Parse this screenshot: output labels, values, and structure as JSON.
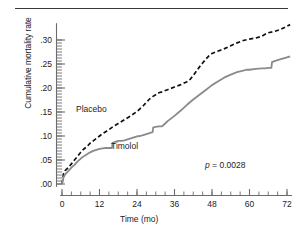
{
  "figure": {
    "has_top_rule": true,
    "background_color": "#ffffff"
  },
  "chart_data": {
    "type": "line",
    "title": "",
    "xlabel": "Time (mo)",
    "ylabel": "Cumulative mortality rate",
    "xlim": [
      0,
      74
    ],
    "ylim": [
      0,
      0.335
    ],
    "xticks": [
      0,
      12,
      24,
      36,
      48,
      60,
      72
    ],
    "xtick_labels": [
      "0",
      "12",
      "24",
      "36",
      "48",
      "60",
      "72"
    ],
    "x_minor_tick_interval": 3,
    "yticks": [
      0.0,
      0.05,
      0.1,
      0.15,
      0.2,
      0.25,
      0.3
    ],
    "ytick_labels": [
      ".00",
      ".05",
      ".10",
      ".15",
      ".20",
      ".25",
      ".30"
    ],
    "y_minor_tick_interval": 0.00625,
    "grid": false,
    "legend_position": "inline-annotations",
    "annotations": [
      {
        "name": "p-value",
        "text": "p = 0.0028",
        "italic_prefix": "p",
        "x": 62,
        "y": 0.045
      }
    ],
    "series": [
      {
        "name": "Placebo",
        "style": "dashed",
        "color": "#111111",
        "label_x": 14,
        "label_y": 0.168,
        "x": [
          0,
          0.5,
          1,
          2,
          3,
          4,
          5,
          6,
          7,
          8,
          9,
          10,
          11,
          12,
          13,
          14,
          15,
          16,
          18,
          20,
          22,
          24,
          25,
          26,
          27,
          28,
          29,
          30,
          31,
          32,
          34,
          36,
          38,
          40,
          41,
          42,
          43,
          44,
          45,
          46,
          47,
          48,
          50,
          52,
          54,
          56,
          58,
          60,
          62,
          64,
          65,
          66,
          68,
          70,
          72,
          73
        ],
        "y": [
          0.0,
          0.022,
          0.028,
          0.034,
          0.042,
          0.05,
          0.058,
          0.066,
          0.073,
          0.078,
          0.085,
          0.09,
          0.095,
          0.1,
          0.105,
          0.109,
          0.113,
          0.118,
          0.126,
          0.134,
          0.142,
          0.151,
          0.157,
          0.163,
          0.17,
          0.177,
          0.182,
          0.186,
          0.19,
          0.192,
          0.197,
          0.202,
          0.207,
          0.213,
          0.218,
          0.226,
          0.235,
          0.244,
          0.252,
          0.26,
          0.267,
          0.272,
          0.277,
          0.282,
          0.288,
          0.294,
          0.299,
          0.302,
          0.304,
          0.308,
          0.312,
          0.315,
          0.318,
          0.322,
          0.329,
          0.332
        ]
      },
      {
        "name": "Timolol",
        "style": "solid",
        "color": "#8a8a8a",
        "label_x": 30,
        "label_y": 0.093,
        "x": [
          0,
          0.5,
          1,
          2,
          3,
          4,
          5,
          6,
          7,
          8,
          9,
          10,
          11,
          12,
          13,
          14,
          15,
          16,
          16.2,
          17,
          18,
          19,
          20,
          21,
          22,
          23,
          24,
          25,
          26,
          27,
          28,
          29,
          29.2,
          30,
          31,
          32,
          33,
          34,
          36,
          38,
          40,
          42,
          44,
          46,
          48,
          50,
          52,
          54,
          56,
          58,
          59,
          60,
          62,
          64,
          65,
          66,
          67,
          67.2,
          68,
          70,
          72,
          73
        ],
        "y": [
          0.0,
          0.014,
          0.02,
          0.027,
          0.034,
          0.04,
          0.047,
          0.053,
          0.058,
          0.062,
          0.066,
          0.069,
          0.071,
          0.073,
          0.074,
          0.075,
          0.075,
          0.075,
          0.086,
          0.088,
          0.09,
          0.09,
          0.091,
          0.093,
          0.095,
          0.097,
          0.099,
          0.1,
          0.102,
          0.104,
          0.106,
          0.108,
          0.118,
          0.119,
          0.12,
          0.12,
          0.126,
          0.132,
          0.142,
          0.153,
          0.165,
          0.176,
          0.186,
          0.196,
          0.206,
          0.214,
          0.222,
          0.228,
          0.233,
          0.236,
          0.238,
          0.238,
          0.24,
          0.241,
          0.241,
          0.242,
          0.242,
          0.254,
          0.256,
          0.26,
          0.264,
          0.266
        ]
      }
    ]
  },
  "axes": {
    "y_axis_label": "Cumulative mortality rate",
    "x_axis_label": "Time (mo)",
    "spine_color": "#6b6b6b"
  },
  "labels": {
    "placebo": "Placebo",
    "timolol": "Timolol",
    "pvalue_prefix": "p",
    "pvalue_rest": " = 0.0028",
    "ytick_0": ".00",
    "ytick_1": ".05",
    "ytick_2": ".10",
    "ytick_3": ".15",
    "ytick_4": ".20",
    "ytick_5": ".25",
    "ytick_6": ".30",
    "xtick_0": "0",
    "xtick_1": "12",
    "xtick_2": "24",
    "xtick_3": "36",
    "xtick_4": "48",
    "xtick_5": "60",
    "xtick_6": "72"
  }
}
